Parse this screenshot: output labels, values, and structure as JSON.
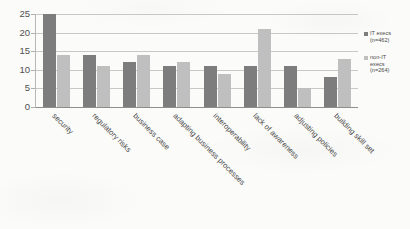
{
  "chart_data": {
    "type": "bar",
    "title": "",
    "xlabel": "",
    "ylabel": "",
    "ylim": [
      0,
      25
    ],
    "yticks": [
      25,
      20,
      15,
      10,
      5,
      0
    ],
    "grid": true,
    "legend_position": "right",
    "categories": [
      "security",
      "regulatory risks",
      "business case",
      "adapting business processes",
      "interoperability",
      "lack of awareness",
      "adjusting policies",
      "building skill set"
    ],
    "series": [
      {
        "name": "IT execs (n=462)",
        "legend_line1": "IT execs",
        "legend_line2": "(n=462)",
        "color": "#7d7d7d",
        "values": [
          25,
          14,
          12,
          11,
          11,
          11,
          11,
          8
        ]
      },
      {
        "name": "non-IT execs (n=264)",
        "legend_line1": "non-IT",
        "legend_line2": "execs",
        "legend_line3": "(n=264)",
        "color": "#bfbfbf",
        "values": [
          14,
          11,
          14,
          12,
          9,
          21,
          5,
          13
        ]
      }
    ]
  }
}
